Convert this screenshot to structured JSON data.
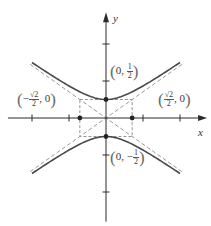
{
  "figure": {
    "width": 211,
    "height": 226,
    "origin_px": [
      106,
      118
    ],
    "unit_px": 37,
    "colors": {
      "axis": "#2b2b2b",
      "curve": "#4a4a4a",
      "asymptote": "#9a9a9a",
      "box": "#8a8a8a",
      "point": "#222222"
    }
  },
  "axes": {
    "x_label": "x",
    "y_label": "y",
    "x_range": [
      -2.65,
      2.65
    ],
    "y_range": [
      -2.8,
      2.75
    ],
    "x_ticks": [
      -2,
      -1,
      1,
      2
    ],
    "y_ticks": [
      -2,
      -1,
      1,
      2
    ]
  },
  "curve": {
    "equation": "4y^2 - 2x^2 = 1",
    "a": 0.5,
    "b": 0.7071,
    "x_extent": [
      -2,
      2
    ]
  },
  "asymptotes": {
    "slope": 0.7071,
    "x_extent": [
      -2.05,
      2.05
    ]
  },
  "box": {
    "x": [
      -0.7071,
      0.7071
    ],
    "y": [
      -0.5,
      0.5
    ]
  },
  "points": [
    {
      "x": 0,
      "y": 0.5,
      "label_id": "top"
    },
    {
      "x": 0,
      "y": -0.5,
      "label_id": "bottom"
    },
    {
      "x": -0.7071,
      "y": 0,
      "label_id": "left"
    },
    {
      "x": 0.7071,
      "y": 0,
      "label_id": "right"
    }
  ],
  "labels": {
    "top": {
      "open": "(",
      "a": "0,",
      "num": "1",
      "den": "2",
      "close": ")"
    },
    "bottom": {
      "open": "(",
      "a": "0, −",
      "num": "1",
      "den": "2",
      "close": ")"
    },
    "left": {
      "open": "(",
      "sign": "−",
      "num": "√2",
      "den": "2",
      "b": ", 0",
      "close": ")"
    },
    "right": {
      "open": "(",
      "num": "√2",
      "den": "2",
      "b": ", 0",
      "close": ")"
    }
  }
}
